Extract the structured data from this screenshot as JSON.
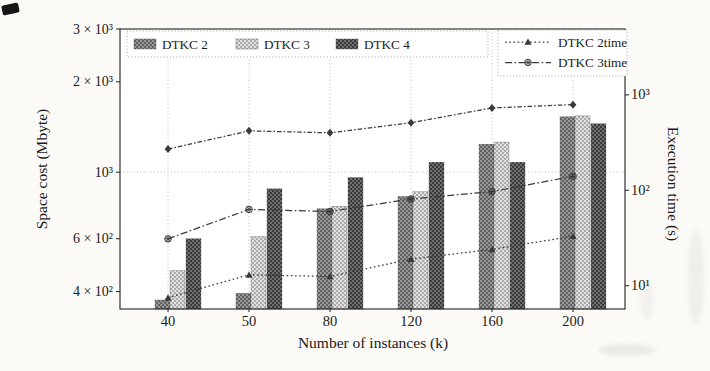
{
  "chart_data": {
    "type": "bar+line",
    "title": "",
    "xlabel": "Number of instances (k)",
    "ylabel_left": "Space cost (Mbyte)",
    "ylabel_right": "Execution time (s)",
    "categories": [
      40,
      50,
      80,
      120,
      160,
      200
    ],
    "left_scale": "log",
    "right_scale": "log",
    "left_ylim": [
      350,
      3000
    ],
    "right_ylim": [
      5.7,
      4900
    ],
    "left_ticks": [
      {
        "v": 3000,
        "label": "3 × 10³"
      },
      {
        "v": 2000,
        "label": "2 × 10³"
      },
      {
        "v": 1000,
        "label": "10³"
      },
      {
        "v": 600,
        "label": "6 × 10²"
      },
      {
        "v": 400,
        "label": "4 × 10²"
      }
    ],
    "right_ticks": [
      {
        "v": 1000,
        "label": "10³"
      },
      {
        "v": 100,
        "label": "10²"
      },
      {
        "v": 10,
        "label": "10¹"
      }
    ],
    "grid": {
      "vertical_at_categories": true,
      "horizontal_left_values": [
        1000
      ]
    },
    "bar_series": [
      {
        "name": "DTKC 2",
        "axis": "left",
        "hatch_colors": [
          "#616161",
          "#989898"
        ],
        "values": [
          375,
          395,
          755,
          830,
          1240,
          1530
        ]
      },
      {
        "name": "DTKC 3",
        "axis": "left",
        "hatch_colors": [
          "#ababab",
          "#e0e0e0"
        ],
        "values": [
          470,
          610,
          770,
          860,
          1260,
          1540
        ]
      },
      {
        "name": "DTKC 4",
        "axis": "left",
        "hatch_colors": [
          "#3a3a3a",
          "#6e6e6e"
        ],
        "values": [
          600,
          880,
          960,
          1080,
          1080,
          1450
        ]
      }
    ],
    "line_series": [
      {
        "name": "DTKC 2time",
        "axis": "right",
        "linestyle": "dotted",
        "marker": "triangle",
        "in_legend": true,
        "values": [
          7.5,
          13,
          12.5,
          19,
          24,
          33
        ]
      },
      {
        "name": "DTKC 3time",
        "axis": "right",
        "linestyle": "dashed",
        "marker": "circled-star",
        "in_legend": true,
        "values": [
          31,
          63,
          60,
          81,
          97,
          140
        ]
      },
      {
        "name": "",
        "axis": "right",
        "linestyle": "dashdot",
        "marker": "diamond",
        "in_legend": false,
        "values": [
          270,
          420,
          400,
          510,
          730,
          790
        ]
      }
    ],
    "line_color": "#3a3a3a",
    "frame_color": "#202020",
    "grid_color": "#b4b4b4",
    "legend_bars_position": "upper left",
    "legend_lines_position": "upper right"
  }
}
